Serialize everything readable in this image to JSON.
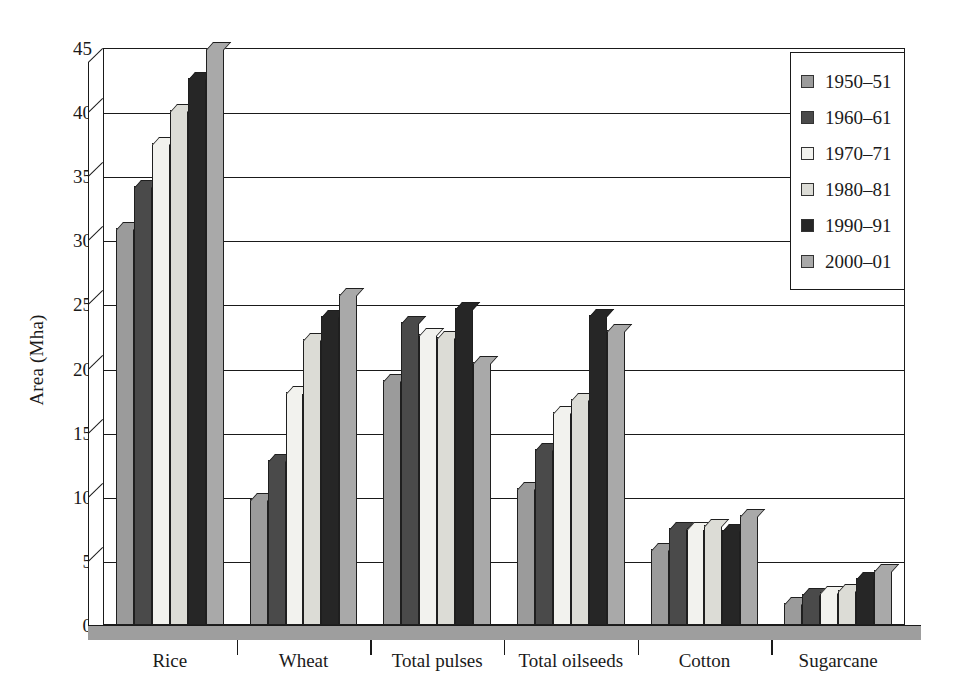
{
  "chart_data": {
    "type": "bar",
    "title": "",
    "xlabel": "",
    "ylabel": "Area (Mha)",
    "ylim": [
      0,
      45
    ],
    "ytick_step": 5,
    "yticks": [
      0,
      5,
      10,
      15,
      20,
      25,
      30,
      35,
      40,
      45
    ],
    "grid": true,
    "legend_position": "top-right",
    "categories": [
      "Rice",
      "Wheat",
      "Total pulses",
      "Total oilseeds",
      "Cotton",
      "Sugarcane"
    ],
    "series": [
      {
        "name": "1950–51",
        "color": "#9b9b9b",
        "values": [
          31.0,
          9.8,
          19.1,
          10.7,
          5.9,
          1.7
        ]
      },
      {
        "name": "1960–61",
        "color": "#4a4a4a",
        "values": [
          34.2,
          12.9,
          23.6,
          13.7,
          7.6,
          2.4
        ]
      },
      {
        "name": "1970–71",
        "color": "#f2f2ee",
        "values": [
          37.6,
          18.2,
          22.7,
          16.6,
          7.6,
          2.6
        ]
      },
      {
        "name": "1980–81",
        "color": "#dcdcd6",
        "values": [
          40.2,
          22.3,
          22.5,
          17.6,
          7.8,
          2.7
        ]
      },
      {
        "name": "1990–91",
        "color": "#262626",
        "values": [
          42.7,
          24.1,
          24.7,
          24.2,
          7.4,
          3.7
        ]
      },
      {
        "name": "2000–01",
        "color": "#a9a9a9",
        "values": [
          45.0,
          25.8,
          20.5,
          23.0,
          8.6,
          4.3
        ]
      }
    ]
  },
  "axis": {
    "y_title": "Area (Mha)"
  },
  "colors": {
    "frame": "#1a1a1a",
    "floor": "#9e9e9e",
    "background": "#ffffff"
  }
}
